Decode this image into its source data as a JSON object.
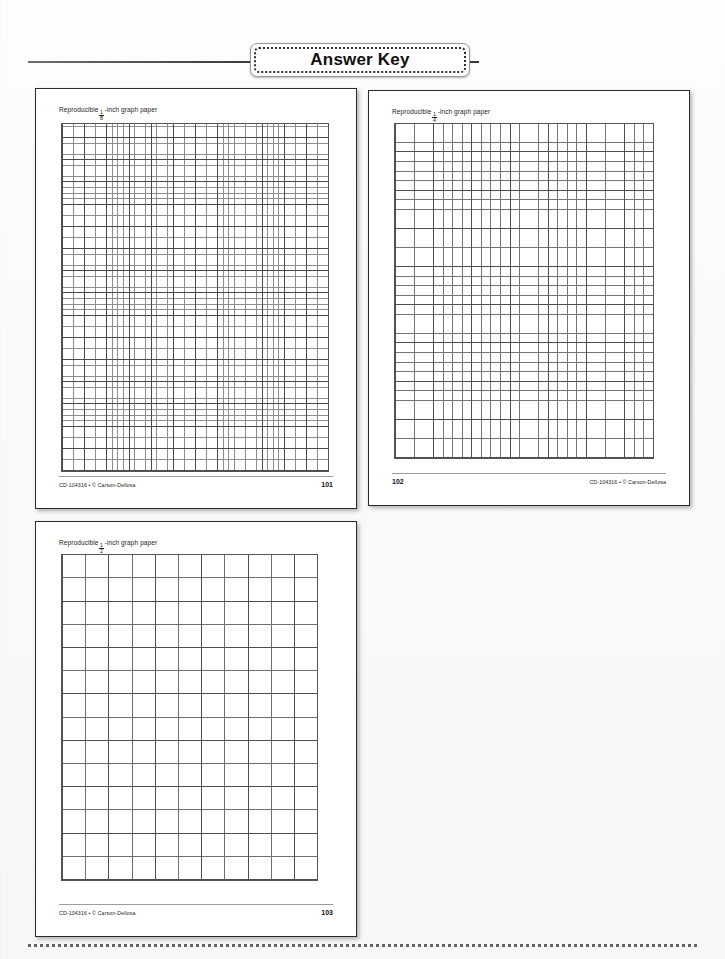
{
  "header": {
    "title": "Answer Key"
  },
  "pages": [
    {
      "id": "page-eighth",
      "heading_prefix": "Reproducible",
      "fraction_numerator": "1",
      "fraction_denominator": "8",
      "heading_suffix": "-inch graph paper",
      "grid_label": "1/8-inch grid",
      "credit": "CD-104316 • © Carson-Dellosa",
      "page_number": "101",
      "credit_align": "left",
      "pageno_align": "right"
    },
    {
      "id": "page-quarter",
      "heading_prefix": "Reproducible",
      "fraction_numerator": "1",
      "fraction_denominator": "4",
      "heading_suffix": "-inch graph paper",
      "grid_label": "1/4-inch grid",
      "credit": "CD-104316 • © Carson-Dellosa",
      "page_number": "102",
      "credit_align": "right",
      "pageno_align": "left"
    },
    {
      "id": "page-half",
      "heading_prefix": "Reproducible",
      "fraction_numerator": "1",
      "fraction_denominator": "2",
      "heading_suffix": "-inch graph paper",
      "grid_label": "1/2-inch grid",
      "credit": "CD-104316 • © Carson-Dellosa",
      "page_number": "103",
      "credit_align": "left",
      "pageno_align": "right"
    }
  ],
  "colors": {
    "rule": "#4a4a4a",
    "page_border": "#2b2b2b",
    "grid_major": "#4f4f4f",
    "grid_minor": "#8d8d8d",
    "text": "#1c1c1c",
    "background": "#fafafa"
  }
}
